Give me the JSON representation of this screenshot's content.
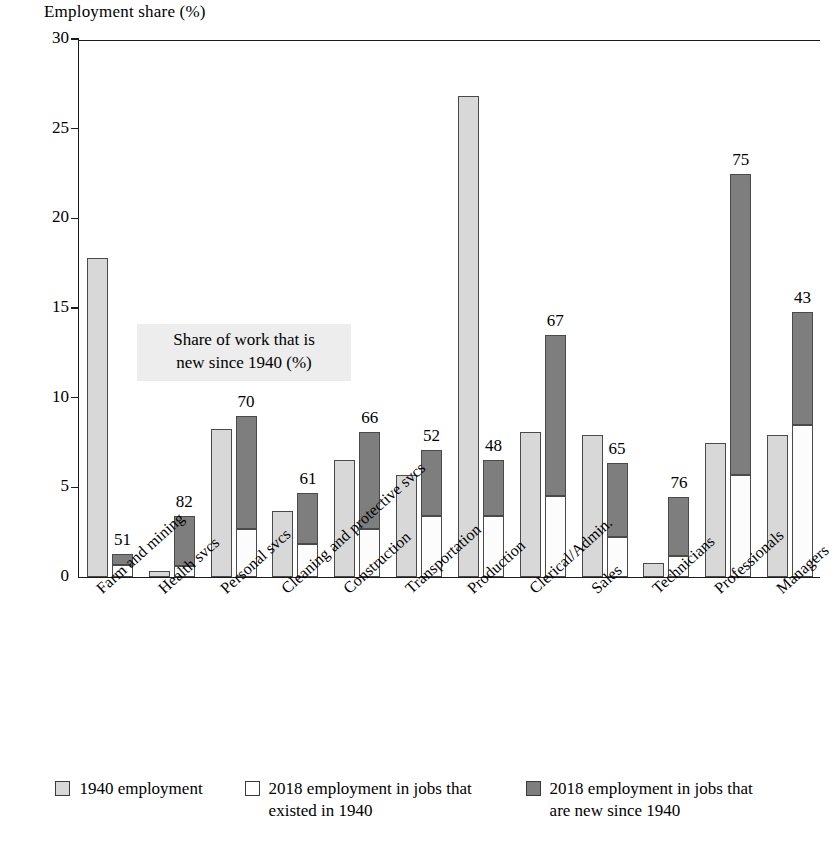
{
  "chart_data": {
    "type": "bar",
    "subtype": "grouped-stacked",
    "title": "",
    "ylabel": "Employment share (%)",
    "xlabel": "",
    "ylim": [
      0,
      30
    ],
    "yticks": [
      0,
      5,
      10,
      15,
      20,
      25,
      30
    ],
    "grid": false,
    "legend_position": "bottom",
    "annotation": {
      "line1": "Share of work that is",
      "line2": "new since 1940 (%)"
    },
    "categories": [
      "Farm and mining",
      "Health svcs",
      "Personal svcs",
      "Cleaning and protective svcs",
      "Construction",
      "Transportation",
      "Production",
      "Clerical/Admin.",
      "Sales",
      "Technicians",
      "Professionals",
      "Managers"
    ],
    "series": [
      {
        "name": "1940 employment",
        "key": "emp1940",
        "color": "#d8d8d8",
        "values": [
          17.8,
          0.35,
          8.25,
          3.7,
          6.5,
          5.7,
          26.8,
          8.1,
          7.9,
          0.8,
          7.5,
          7.9
        ]
      },
      {
        "name": "2018 employment in jobs that existed in 1940",
        "key": "emp2018_old",
        "color": "#ffffff",
        "values": [
          0.65,
          0.6,
          2.7,
          1.85,
          2.7,
          3.4,
          3.4,
          4.5,
          2.25,
          1.15,
          5.7,
          8.5
        ]
      },
      {
        "name": "2018 employment in jobs that are new since 1940",
        "key": "emp2018_new",
        "color": "#7e7e7e",
        "values": [
          0.65,
          2.8,
          6.3,
          2.85,
          5.4,
          3.7,
          3.1,
          9.0,
          4.1,
          3.3,
          16.8,
          6.3
        ]
      }
    ],
    "new_share_labels": [
      51,
      82,
      70,
      61,
      66,
      52,
      48,
      67,
      65,
      76,
      75,
      43
    ]
  },
  "legend": {
    "items": [
      {
        "swatch": "s1940",
        "label": "1940 employment"
      },
      {
        "swatch": "sold",
        "label": "2018 employment in jobs that existed in 1940"
      },
      {
        "swatch": "snew",
        "label": "2018 employment in jobs that are new since 1940"
      }
    ]
  }
}
